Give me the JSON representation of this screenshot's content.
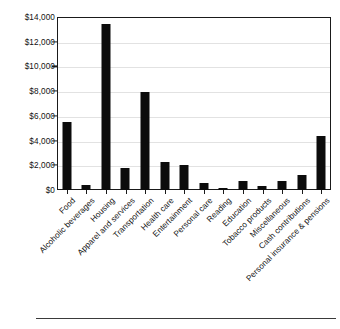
{
  "chart_data": {
    "type": "bar",
    "title": "",
    "subtitle": "",
    "xlabel": "",
    "ylabel": "",
    "ylim": [
      0,
      14000
    ],
    "ytick_labels": [
      "$14,000",
      "$12,000",
      "$10,000",
      "$8,000",
      "$6,000",
      "$4,000",
      "$2,000",
      "$0"
    ],
    "ytick_values": [
      14000,
      12000,
      10000,
      8000,
      6000,
      4000,
      2000,
      0
    ],
    "grid": true,
    "legend": "none",
    "categories": [
      "Food",
      "Alcoholic beverages",
      "Housing",
      "Apparel and services",
      "Transportation",
      "Health care",
      "Entertainment",
      "Personal care",
      "Reading",
      "Education",
      "Tobacco products",
      "Miscellaneous",
      "Cash contributions",
      "Personal insurance & pensions"
    ],
    "values": [
      5500,
      400,
      13450,
      1750,
      7900,
      2300,
      2050,
      550,
      150,
      700,
      300,
      750,
      1250,
      4400
    ],
    "bar_color": "#0c0c0c",
    "plot_border_color": "#1a1a1a",
    "gridline_color": "#e2e2e2",
    "background_color": "#ffffff"
  }
}
